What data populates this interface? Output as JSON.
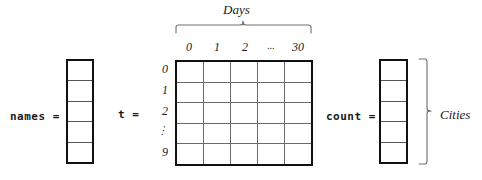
{
  "figure": {
    "title": "",
    "background": "#ffffff",
    "line_color": "#111111",
    "grid_color": "#6a6a6a",
    "brace_color": "#6e6e6e"
  },
  "names_vector": {
    "label": "names =",
    "cell_count": 5
  },
  "matrix": {
    "label": "t =",
    "column_headers": [
      "0",
      "1",
      "2",
      "...",
      "30"
    ],
    "row_headers": [
      "0",
      "1",
      "2",
      "⋮",
      "9"
    ],
    "row_dots": "⋮",
    "columns": 5,
    "rows": 5,
    "top_brace_label": "Days"
  },
  "count_vector": {
    "label": "count =",
    "cell_count": 5,
    "right_brace_label": "Cities"
  }
}
